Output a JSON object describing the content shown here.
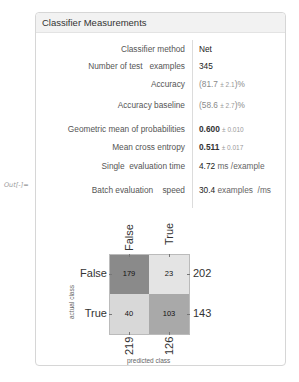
{
  "output_label": "Out[-]=",
  "panel": {
    "title": "Classifier Measurements"
  },
  "measurements": [
    {
      "label": "Classifier method",
      "value": "Net"
    },
    {
      "label": "Number of test   examples",
      "value": "345"
    },
    {
      "label": "Accuracy",
      "value_open": "(81.7 ",
      "pm": "± 2.1",
      "value_close": ")%"
    },
    {
      "label": "Accuracy baseline",
      "value_open": "(58.6 ",
      "pm": "± 2.7",
      "value_close": ")%"
    },
    {
      "label": "Geometric mean of probabilities",
      "value": "0.600",
      "pm": "± 0.010"
    },
    {
      "label": "Mean cross entropy",
      "value": "0.511",
      "pm": "± 0.017"
    },
    {
      "label": "Single  evaluation time",
      "value": "4.72",
      "unit": " ms /example"
    },
    {
      "label": "Batch evaluation    speed",
      "value": "30.4",
      "unit": " examples  /ms"
    }
  ],
  "confusion_matrix": {
    "column_labels": [
      "False",
      "True"
    ],
    "row_labels": [
      "False",
      "True"
    ],
    "cells": [
      [
        179,
        23
      ],
      [
        40,
        103
      ]
    ],
    "row_totals": [
      202,
      143
    ],
    "column_totals": [
      219,
      126
    ],
    "x_axis_label": "predicted class",
    "y_axis_label": "actual class",
    "colors": {
      "cell_0_0": "#8a8a8a",
      "cell_0_1": "#e4e4e4",
      "cell_1_0": "#d8d8d8",
      "cell_1_1": "#a9a9a9"
    }
  }
}
